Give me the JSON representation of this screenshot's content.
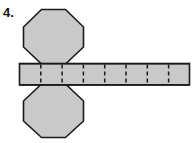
{
  "figure": {
    "problem_number": "4.",
    "kind": "octagonal-prism-net",
    "colors": {
      "face_fill": "#c9c9c9",
      "outline": "#1a1a1a",
      "fold_line": "#1a1a1a",
      "background": "#ffffff"
    },
    "strip": {
      "cell_count": 8,
      "left": 19,
      "right": 190,
      "top": 63,
      "bottom": 85,
      "dividers": [
        40,
        63,
        84,
        105,
        126,
        147,
        168
      ],
      "fold_style": "dashed"
    },
    "octagons": [
      {
        "position": "top",
        "attached_edge_left": 40,
        "attached_edge_right": 63,
        "bbox": {
          "left": 23,
          "top": 9,
          "right": 84,
          "bottom": 64
        }
      },
      {
        "position": "bottom",
        "attached_edge_left": 40,
        "attached_edge_right": 63,
        "bbox": {
          "left": 23,
          "top": 84,
          "right": 84,
          "bottom": 138
        }
      }
    ]
  }
}
